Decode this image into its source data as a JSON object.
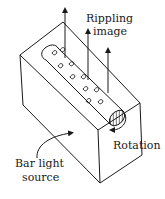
{
  "diagram": {
    "labels": {
      "rippling_line1": "Rippling",
      "rippling_line2": "image",
      "rotation": "Rotation",
      "source_line1": "Bar light",
      "source_line2": "source"
    },
    "elements": {
      "box": "rectangular-block-outline",
      "cylinder": "rotating-cylinder-with-ripples",
      "arrows_up": 3,
      "rotation_arrow": "curved-arrow",
      "source_arrow": "curved-arrow"
    },
    "colors": {
      "ink": "#1a1a1a",
      "background": "#ffffff"
    }
  }
}
